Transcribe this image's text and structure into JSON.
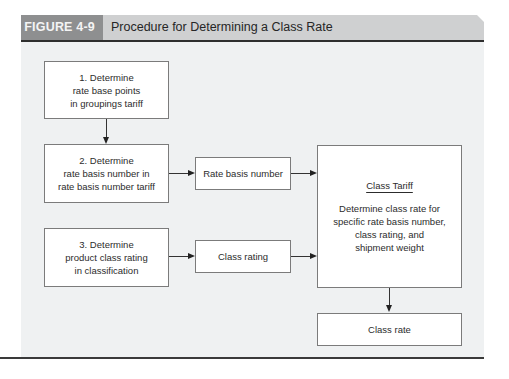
{
  "figure": {
    "label": "FIGURE 4-9",
    "title": "Procedure for Determining a Class Rate",
    "colors": {
      "label_bg": "#8e8f90",
      "title_bg": "#cfd0d1",
      "panel_bg": "#eff1f2",
      "box_border": "#7b7b7b",
      "rule": "#2e2e2e"
    }
  },
  "nodes": {
    "step1": {
      "lines": [
        "1. Determine",
        "rate base points",
        "in groupings tariff"
      ]
    },
    "step2": {
      "lines": [
        "2. Determine",
        "rate basis number in",
        "rate basis number tariff"
      ]
    },
    "step3": {
      "lines": [
        "3. Determine",
        "product class rating",
        "in classification"
      ]
    },
    "rate_basis_number": {
      "label": "Rate basis number"
    },
    "class_rating": {
      "label": "Class rating"
    },
    "class_tariff": {
      "heading": "Class Tariff",
      "lines": [
        "Determine class rate for",
        "specific rate basis number,",
        "class rating, and",
        "shipment weight"
      ]
    },
    "class_rate": {
      "label": "Class rate"
    }
  },
  "edges": [
    {
      "from": "step1",
      "to": "step2"
    },
    {
      "from": "step2",
      "to": "rate_basis_number"
    },
    {
      "from": "rate_basis_number",
      "to": "class_tariff"
    },
    {
      "from": "step3",
      "to": "class_rating"
    },
    {
      "from": "class_rating",
      "to": "class_tariff"
    },
    {
      "from": "class_tariff",
      "to": "class_rate"
    }
  ]
}
